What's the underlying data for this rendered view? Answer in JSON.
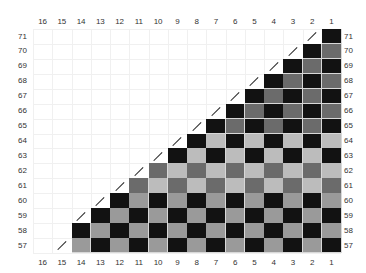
{
  "diagram": {
    "type": "triangular checkerboard grid",
    "columns": [
      "16",
      "15",
      "14",
      "13",
      "12",
      "11",
      "10",
      "9",
      "8",
      "7",
      "6",
      "5",
      "4",
      "3",
      "2",
      "1"
    ],
    "rows": [
      "71",
      "70",
      "69",
      "68",
      "67",
      "66",
      "65",
      "64",
      "63",
      "62",
      "61",
      "60",
      "59",
      "58",
      "57"
    ],
    "colors": {
      "black": "#121212",
      "dark_gray": "#6b6b6b",
      "light_gray": "#bcbcbc",
      "mid_gray": "#9a9a9a",
      "gridline": "#f0f0f0",
      "label": "#333333"
    },
    "row_patterns": {
      "71": {
        "first_col": 1,
        "slash_col": 2,
        "even": "black",
        "odd": "dark_gray"
      },
      "70": {
        "first_col": 2,
        "slash_col": 3,
        "even": "black",
        "odd": "dark_gray"
      },
      "69": {
        "first_col": 3,
        "slash_col": 4,
        "even": "black",
        "odd": "dark_gray"
      },
      "68": {
        "first_col": 4,
        "slash_col": 5,
        "even": "black",
        "odd": "dark_gray"
      },
      "67": {
        "first_col": 5,
        "slash_col": 6,
        "even": "black",
        "odd": "dark_gray"
      },
      "66": {
        "first_col": 6,
        "slash_col": 7,
        "even": "black",
        "odd": "dark_gray"
      },
      "65": {
        "first_col": 7,
        "slash_col": 8,
        "even": "black",
        "odd": "dark_gray"
      },
      "64": {
        "first_col": 8,
        "slash_col": 9,
        "even": "black",
        "odd": "light_gray"
      },
      "63": {
        "first_col": 9,
        "slash_col": 10,
        "even": "black",
        "odd": "light_gray"
      },
      "62": {
        "first_col": 10,
        "slash_col": 11,
        "even": "dark_gray",
        "odd": "light_gray"
      },
      "61": {
        "first_col": 11,
        "slash_col": 12,
        "even": "dark_gray",
        "odd": "light_gray"
      },
      "60": {
        "first_col": 12,
        "slash_col": 13,
        "even": "black",
        "odd": "mid_gray"
      },
      "59": {
        "first_col": 13,
        "slash_col": 14,
        "even": "black",
        "odd": "mid_gray"
      },
      "58": {
        "first_col": 14,
        "slash_col": null,
        "even": "black",
        "odd": "mid_gray"
      },
      "57": {
        "first_col": 14,
        "slash_col": 15,
        "even": "black",
        "odd": "mid_gray"
      }
    },
    "parity_rule": "cell color 'even' when row+col is even, else 'odd'"
  }
}
